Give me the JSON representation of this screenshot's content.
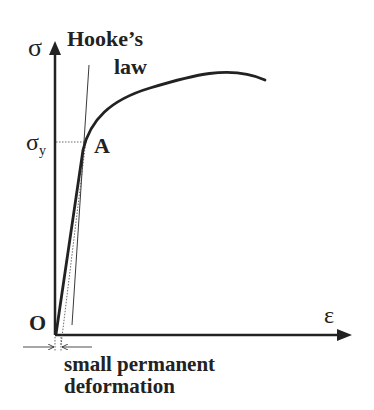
{
  "diagram": {
    "labels": {
      "y_axis": "σ",
      "x_axis": "ε",
      "origin": "O",
      "yield_stress": "σ",
      "yield_subscript": "y",
      "point_a": "A",
      "hookes_law_line1": "Hooke’s",
      "hookes_law_line2": "law",
      "permanent_line1": "small permanent",
      "permanent_line2": "deformation"
    },
    "colors": {
      "ink": "#222222",
      "background": "#ffffff"
    }
  }
}
